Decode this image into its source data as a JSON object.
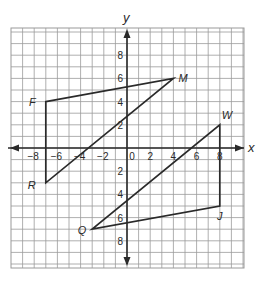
{
  "chart_data": {
    "type": "coordinate-plane",
    "title": "",
    "xlabel": "x",
    "ylabel": "y",
    "xlim": [
      -10,
      10
    ],
    "ylim": [
      -10,
      10
    ],
    "grid": true,
    "x_tick_labels": [
      "-8",
      "-6",
      "-4",
      "-2",
      "0",
      "2",
      "4",
      "6",
      "8"
    ],
    "x_ticks": [
      -8,
      -6,
      -4,
      -2,
      0,
      2,
      4,
      6,
      8
    ],
    "y_tick_labels": [
      "8",
      "6",
      "4",
      "2",
      "2",
      "4",
      "6",
      "8"
    ],
    "y_ticks": [
      8,
      6,
      4,
      2,
      -2,
      -4,
      -6,
      -8
    ],
    "points": [
      {
        "name": "F",
        "x": -7,
        "y": 4
      },
      {
        "name": "M",
        "x": 4,
        "y": 6
      },
      {
        "name": "R",
        "x": -7,
        "y": -3
      },
      {
        "name": "W",
        "x": 8,
        "y": 2
      },
      {
        "name": "J",
        "x": 8,
        "y": -5
      },
      {
        "name": "Q",
        "x": -3,
        "y": -7
      }
    ],
    "polygons": [
      {
        "name": "triangle-FMR",
        "vertices": [
          "F",
          "M",
          "R"
        ]
      },
      {
        "name": "triangle-WJQ",
        "vertices": [
          "W",
          "J",
          "Q"
        ]
      }
    ]
  },
  "axes": {
    "x_label": "x",
    "y_label": "y"
  },
  "colors": {
    "grid": "#9a9a9a",
    "axis": "#2a2a2a",
    "lines": "#2a2a2a",
    "text": "#2a2a2a"
  }
}
